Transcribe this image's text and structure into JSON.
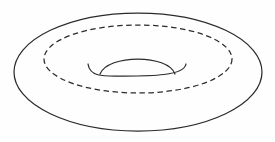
{
  "figure": {
    "background_color": "#fefefe",
    "ink_color": "#2b2b2b",
    "canvas": {
      "width": 275,
      "height": 142
    }
  },
  "chart_data": {
    "type": "diagram",
    "xlabel": "",
    "ylabel": "",
    "xlim": [
      0,
      275
    ],
    "ylim": [
      0,
      142
    ],
    "grid": false,
    "legend": "none",
    "shapes": [
      {
        "name": "outer-silhouette-ellipse",
        "kind": "ellipse",
        "style": "solid",
        "stroke": "#2b2b2b",
        "stroke_width": 1.25,
        "cx": 138,
        "cy": 72,
        "rx": 124,
        "ry": 59,
        "bounds": {
          "x_min": 14,
          "x_max": 262,
          "y_min": 13,
          "y_max": 131
        }
      },
      {
        "name": "hidden-core-circle",
        "kind": "ellipse",
        "style": "dashed",
        "stroke": "#2b2b2b",
        "stroke_width": 1.25,
        "dash_length": 5.5,
        "gap_length": 3.5,
        "cx": 138,
        "cy": 59,
        "rx": 94,
        "ry": 34,
        "bounds": {
          "x_min": 44,
          "x_max": 232,
          "y_min": 25,
          "y_max": 93
        }
      },
      {
        "name": "inner-hole-upper-arc",
        "kind": "arc",
        "style": "solid",
        "stroke": "#2b2b2b",
        "stroke_width": 1.25,
        "start": [
          100,
          74
        ],
        "control": [
          138,
          47
        ],
        "end": [
          175,
          74
        ],
        "apex_y": 58,
        "note": "dome-shaped far rim of the central opening"
      },
      {
        "name": "inner-hole-lower-arc",
        "kind": "arc",
        "style": "solid",
        "stroke": "#2b2b2b",
        "stroke_width": 1.25,
        "start": [
          88,
          64
        ],
        "control": [
          137,
          86
        ],
        "end": [
          186,
          64
        ],
        "nadir_y": 76,
        "note": "near rim of the central opening, wider than the upper arc, ends curling upward"
      }
    ]
  }
}
